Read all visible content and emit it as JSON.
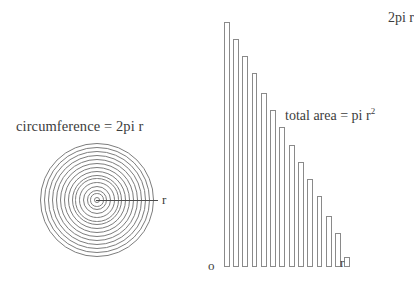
{
  "figure": {
    "background_color": "#ffffff",
    "stroke_color": "#7d7d7d",
    "text_color": "#3c3c3c"
  },
  "circle_panel": {
    "circumference_label": "circumference = 2pi r",
    "radius_label": "r",
    "ring_count": 15,
    "center_x": 96,
    "center_y": 200,
    "outer_radius": 57
  },
  "bar_panel": {
    "top_axis_label": "2pi r",
    "origin_label": "o",
    "right_axis_label": "r",
    "area_annotation_text": "total area = pi r",
    "area_annotation_exponent": "2"
  },
  "chart_data": {
    "type": "bar",
    "title": "",
    "subtitle": "",
    "xlabel": "r",
    "ylabel": "2pi r",
    "grid": false,
    "legend": null,
    "categories": [
      "1",
      "2",
      "3",
      "4",
      "5",
      "6",
      "7",
      "8",
      "9",
      "10",
      "11",
      "12",
      "13",
      "14"
    ],
    "x": [
      1,
      2,
      3,
      4,
      5,
      6,
      7,
      8,
      9,
      10,
      11,
      12,
      13,
      14
    ],
    "values": [
      100,
      93,
      86,
      79,
      71,
      64,
      57,
      50,
      43,
      36,
      29,
      21,
      14,
      4
    ],
    "xlim": [
      0,
      14
    ],
    "ylim": [
      0,
      100
    ],
    "ytick_labels": [
      "o",
      "2pi r"
    ],
    "xtick_labels": [
      "o",
      "r"
    ],
    "annotations": [
      {
        "text": "total area = pi r^2",
        "x": 6.5,
        "y": 62
      },
      {
        "text": "2pi r",
        "x": 0,
        "y": 100
      },
      {
        "text": "o",
        "x": 0,
        "y": 0
      },
      {
        "text": "r",
        "x": 14,
        "y": 0
      }
    ]
  }
}
